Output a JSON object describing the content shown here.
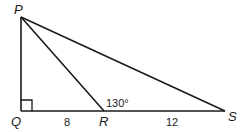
{
  "diagram": {
    "type": "geometry-triangle",
    "points": {
      "P": {
        "label": "P"
      },
      "Q": {
        "label": "Q"
      },
      "R": {
        "label": "R"
      },
      "S": {
        "label": "S"
      }
    },
    "segments": [
      {
        "from": "P",
        "to": "Q"
      },
      {
        "from": "Q",
        "to": "S"
      },
      {
        "from": "P",
        "to": "S"
      },
      {
        "from": "P",
        "to": "R"
      }
    ],
    "right_angle_at": "Q",
    "measurements": {
      "QR": "8",
      "RS": "12",
      "angle_PRS": "130°"
    },
    "colors": {
      "stroke": "#1a1a1a",
      "background": "#ffffff"
    }
  }
}
